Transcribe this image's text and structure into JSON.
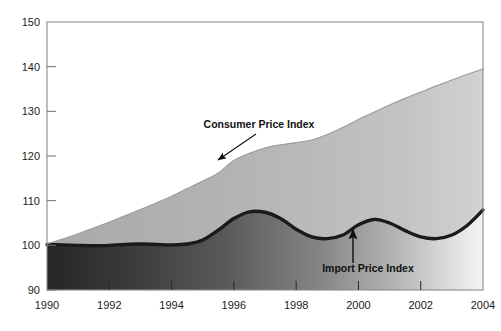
{
  "chart_data": {
    "type": "area",
    "title": "",
    "subtitle": "",
    "xlabel": "",
    "ylabel": "",
    "xlim": [
      1990,
      2004
    ],
    "ylim": [
      90,
      150
    ],
    "grid": false,
    "legend_position": "inline-annotations",
    "x_ticks": [
      1990,
      1992,
      1994,
      1996,
      1998,
      2000,
      2002,
      2004
    ],
    "x_tick_labels": [
      "1990",
      "1992",
      "1994",
      "1996",
      "1998",
      "2000",
      "2002",
      "2004"
    ],
    "y_ticks": [
      90,
      100,
      110,
      120,
      130,
      140,
      150
    ],
    "y_tick_labels": [
      "90",
      "100",
      "110",
      "120",
      "130",
      "140",
      "150"
    ],
    "x": [
      1990,
      1990.5,
      1991,
      1991.5,
      1992,
      1992.5,
      1993,
      1993.5,
      1994,
      1994.5,
      1995,
      1995.5,
      1996,
      1996.5,
      1997,
      1997.5,
      1998,
      1998.5,
      1999,
      1999.5,
      2000,
      2000.5,
      2001,
      2001.5,
      2002,
      2002.5,
      2003,
      2003.5,
      2004
    ],
    "series": [
      {
        "name": "Consumer Price Index",
        "color": "#b6b6b6",
        "style": "filled-area",
        "values": [
          100.3,
          101.4,
          102.6,
          103.9,
          105.2,
          106.6,
          108.0,
          109.5,
          111.0,
          112.7,
          114.4,
          116.2,
          119.0,
          120.6,
          121.8,
          122.5,
          123.0,
          123.6,
          124.8,
          126.4,
          128.2,
          129.8,
          131.4,
          132.9,
          134.3,
          135.7,
          137.0,
          138.3,
          139.5
        ]
      },
      {
        "name": "Import Price Index",
        "color": "#1a1a1a",
        "style": "thick-line",
        "values": [
          100.2,
          100.1,
          100.0,
          99.9,
          100.0,
          100.2,
          100.3,
          100.2,
          100.1,
          100.3,
          101.2,
          103.4,
          106.0,
          107.5,
          107.4,
          106.0,
          103.6,
          101.9,
          101.5,
          102.3,
          104.6,
          105.8,
          105.0,
          103.3,
          101.9,
          101.5,
          102.3,
          104.5,
          107.9
        ]
      }
    ],
    "annotations": [
      {
        "name": "Consumer Price Index",
        "text": "Consumer Price Index",
        "label_x": 259,
        "label_y": 128,
        "arrow_from_x": 256,
        "arrow_from_y": 134,
        "arrow_to_x": 218,
        "arrow_to_y": 160
      },
      {
        "name": "Import Price Index",
        "text": "Import Price Index",
        "label_x": 368,
        "label_y": 272,
        "arrow_from_x": 353,
        "arrow_from_y": 263,
        "arrow_to_x": 353,
        "arrow_to_y": 229
      }
    ],
    "colors": {
      "background": "#ffffff",
      "frame": "#8a8a8a",
      "cpi_area": "#b6b6b6",
      "ipi_area_left": "#2e2e2e",
      "ipi_area_right": "#efefef",
      "ipi_line": "#1a1a1a",
      "tick_text": "#1c1c1c"
    }
  },
  "axis": {
    "y_labels": [
      "150",
      "140",
      "130",
      "120",
      "110",
      "100",
      "90"
    ],
    "x_labels": [
      "1990",
      "1992",
      "1994",
      "1996",
      "1998",
      "2000",
      "2002",
      "2004"
    ]
  },
  "labels": {
    "cpi": "Consumer Price Index",
    "ipi": "Import Price Index"
  }
}
